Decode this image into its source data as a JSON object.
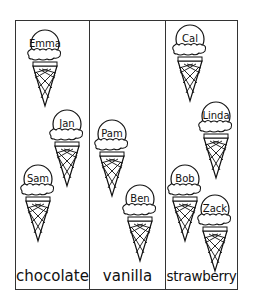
{
  "chart_data": {
    "type": "pictograph",
    "title": "",
    "categories": [
      "chocolate",
      "vanilla",
      "strawberry"
    ],
    "values": [
      3,
      2,
      4
    ],
    "items": {
      "chocolate": [
        "Emma",
        "Jan",
        "Sam"
      ],
      "vanilla": [
        "Pam",
        "Ben"
      ],
      "strawberry": [
        "Cal",
        "Linda",
        "Bob",
        "Zack"
      ]
    },
    "legend": [],
    "xlabel": "",
    "ylabel": ""
  },
  "columns": [
    {
      "label": "chocolate"
    },
    {
      "label": "vanilla"
    },
    {
      "label": "strawberry"
    }
  ],
  "cones": [
    {
      "name": "Emma",
      "x": 25,
      "y": 28
    },
    {
      "name": "Jan",
      "x": 47,
      "y": 108
    },
    {
      "name": "Sam",
      "x": 18,
      "y": 163
    },
    {
      "name": "Pam",
      "x": 92,
      "y": 118
    },
    {
      "name": "Ben",
      "x": 120,
      "y": 183
    },
    {
      "name": "Cal",
      "x": 170,
      "y": 23
    },
    {
      "name": "Linda",
      "x": 196,
      "y": 100
    },
    {
      "name": "Bob",
      "x": 165,
      "y": 163
    },
    {
      "name": "Zack",
      "x": 195,
      "y": 193
    }
  ]
}
